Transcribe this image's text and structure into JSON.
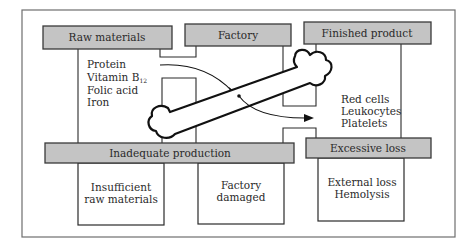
{
  "diagram": {
    "type": "process-flow",
    "bars": {
      "raw_materials": "Raw materials",
      "factory": "Factory",
      "finished_product": "Finished product",
      "inadequate_production": "Inadequate production",
      "excessive_loss": "Excessive loss"
    },
    "raw_materials_items": {
      "protein": "Protein",
      "vitamin": "Vitamin B",
      "vitamin_subscript": "12",
      "folic_acid": "Folic acid",
      "iron": "Iron"
    },
    "finished_product_items": [
      "Red cells",
      "Leukocytes",
      "Platelets"
    ],
    "inadequate_causes": {
      "insufficient": [
        "Insufficient",
        "raw materials"
      ],
      "factory_damaged": [
        "Factory",
        "damaged"
      ]
    },
    "excessive_loss_causes": [
      "External loss",
      "Hemolysis"
    ],
    "icons": {
      "factory_symbol": "bone-icon",
      "flow": "arrow-icon"
    },
    "colors": {
      "bar_fill": "#c4c4c4",
      "outline": "#2a2a2a",
      "background": "#ffffff"
    }
  }
}
